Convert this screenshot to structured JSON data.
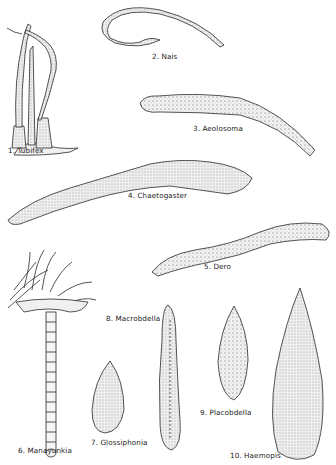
{
  "figure": {
    "labels": [
      {
        "id": "tubifex",
        "text": "1. Tubifex",
        "x": 8,
        "y": 152
      },
      {
        "id": "nais",
        "text": "2. Nais",
        "x": 152,
        "y": 56
      },
      {
        "id": "aeolosoma",
        "text": "3. Aeolosoma",
        "x": 191,
        "y": 128
      },
      {
        "id": "chaetogaster",
        "text": "4. Chaetogaster",
        "x": 128,
        "y": 189
      },
      {
        "id": "dero",
        "text": "5. Dero",
        "x": 205,
        "y": 267
      },
      {
        "id": "manayunkia",
        "text": "6. Manayunkia",
        "x": 18,
        "y": 447
      },
      {
        "id": "glossiphonia",
        "text": "7. Glossiphonia",
        "x": 91,
        "y": 439
      },
      {
        "id": "macrobdella",
        "text": "8. Macrobdella",
        "x": 106,
        "y": 316
      },
      {
        "id": "placobdella",
        "text": "9. Placobdella",
        "x": 200,
        "y": 408
      },
      {
        "id": "haemopis",
        "text": "10. Haemopis",
        "x": 230,
        "y": 452
      }
    ],
    "colors": {
      "ink": "#2a2a2a",
      "paper": "#ffffff",
      "shade": "#d9d9d9"
    }
  }
}
